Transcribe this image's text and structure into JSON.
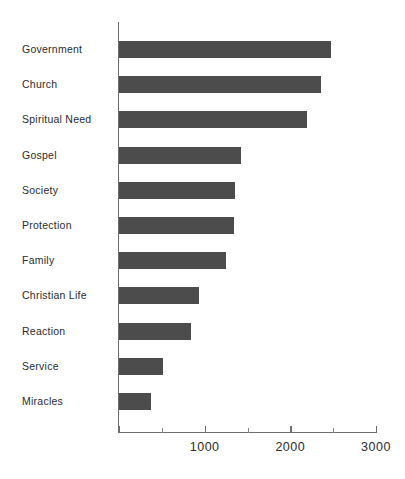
{
  "chart_data": {
    "type": "bar",
    "orientation": "horizontal",
    "title": "",
    "subtitle": "",
    "xlabel": "",
    "ylabel": "",
    "xlim": [
      0,
      3000
    ],
    "grid": false,
    "legend": null,
    "categories": [
      "Government",
      "Church",
      "Spiritual Need",
      "Gospel",
      "Society",
      "Protection",
      "Family",
      "Christian Life",
      "Reaction",
      "Service",
      "Miracles"
    ],
    "values": [
      2470,
      2360,
      2190,
      1420,
      1350,
      1340,
      1245,
      930,
      835,
      510,
      370
    ],
    "x_ticks_major": [
      0,
      1000,
      2000,
      3000
    ],
    "x_tick_labels": [
      "",
      "1000",
      "2000",
      "3000"
    ],
    "x_ticks_minor": [
      500,
      1500,
      2500
    ],
    "bar_color": "#4c4c4c",
    "axis_color": "#6d6d6d",
    "text_color": "#2b2b2b",
    "background_color": "#ffffff"
  }
}
